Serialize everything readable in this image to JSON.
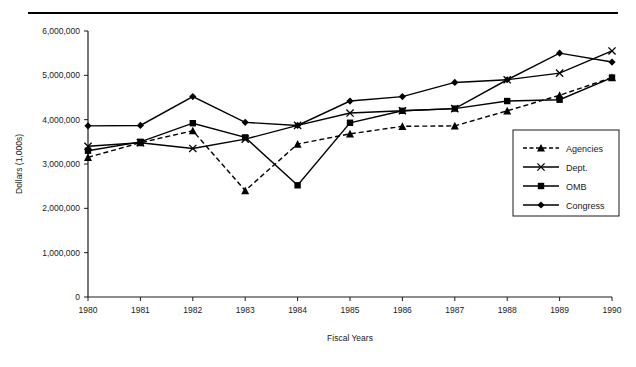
{
  "chart_data": {
    "type": "line",
    "title": "",
    "xlabel": "Fiscal Years",
    "ylabel": "Dollars (1,000s)",
    "categories": [
      "1980",
      "1981",
      "1982",
      "1983",
      "1984",
      "1985",
      "1986",
      "1987",
      "1988",
      "1989",
      "1990"
    ],
    "x": [
      1980,
      1981,
      1982,
      1983,
      1984,
      1985,
      1986,
      1987,
      1988,
      1989,
      1990
    ],
    "ylim": [
      0,
      6000000
    ],
    "xlim": [
      1980,
      1990
    ],
    "ytick_labels": [
      "0",
      "1,000,000",
      "2,000,000",
      "3,000,000",
      "4,000,000",
      "5,000,000",
      "6,000,000"
    ],
    "yticks": [
      0,
      1000000,
      2000000,
      3000000,
      4000000,
      5000000,
      6000000
    ],
    "grid": false,
    "legend_position": "center-right",
    "series": [
      {
        "name": "Agencies",
        "marker": "triangle",
        "line_style": "dashed",
        "color": "#000000",
        "values": [
          3150000,
          3480000,
          3750000,
          2400000,
          3450000,
          3680000,
          3850000,
          3860000,
          4200000,
          4550000,
          4950000
        ]
      },
      {
        "name": "Dept.",
        "marker": "x",
        "line_style": "solid",
        "color": "#000000",
        "values": [
          3400000,
          3480000,
          3350000,
          3560000,
          3870000,
          4150000,
          4200000,
          4250000,
          4900000,
          5050000,
          5550000
        ]
      },
      {
        "name": "OMB",
        "marker": "square",
        "line_style": "solid",
        "color": "#000000",
        "values": [
          3300000,
          3500000,
          3920000,
          3600000,
          2520000,
          3930000,
          4200000,
          4250000,
          4420000,
          4450000,
          4950000
        ]
      },
      {
        "name": "Congress",
        "marker": "diamond",
        "line_style": "solid",
        "color": "#000000",
        "values": [
          3860000,
          3870000,
          4520000,
          3940000,
          3870000,
          4420000,
          4520000,
          4840000,
          4900000,
          5500000,
          5300000
        ]
      }
    ]
  },
  "legend": {
    "items": [
      {
        "label": "Agencies"
      },
      {
        "label": "Dept."
      },
      {
        "label": "OMB"
      },
      {
        "label": "Congress"
      }
    ]
  }
}
